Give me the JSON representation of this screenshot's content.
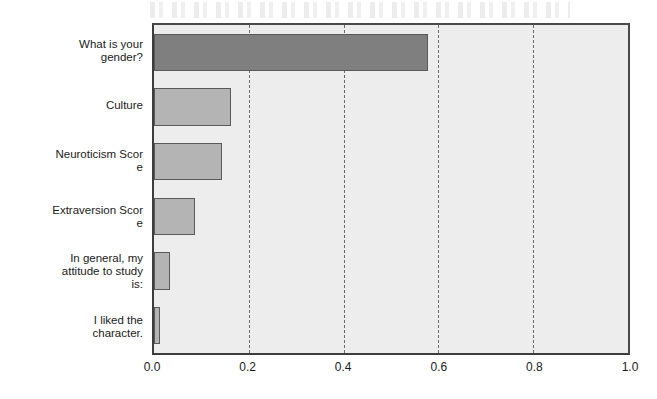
{
  "chart_data": {
    "type": "bar",
    "orientation": "horizontal",
    "title": "",
    "subtitle": "",
    "xlabel": "",
    "ylabel": "",
    "xlim": [
      0.0,
      1.0
    ],
    "xticks": [
      "0.0",
      "0.2",
      "0.4",
      "0.6",
      "0.8",
      "1.0"
    ],
    "xtick_values": [
      0.0,
      0.2,
      0.4,
      0.6,
      0.8,
      1.0
    ],
    "grid": "vertical-dashed",
    "legend": "none",
    "categories": [
      "What is your\ngender?",
      "Culture",
      "Neuroticism Scor\ne",
      "Extraversion Scor\ne",
      "In general, my\nattitude to study\nis:",
      "I liked the\ncharacter."
    ],
    "values": [
      0.578,
      0.163,
      0.143,
      0.087,
      0.033,
      0.013
    ],
    "bar_colors": [
      "#7f7f7f",
      "#b4b4b4",
      "#b4b4b4",
      "#b4b4b4",
      "#b4b4b4",
      "#b4b4b4"
    ],
    "bar_border_color": "#5a5a5a",
    "plot_background": "#ededed",
    "axis_color": "#3d3d3d",
    "gridline_color": "#6b6b6b"
  }
}
